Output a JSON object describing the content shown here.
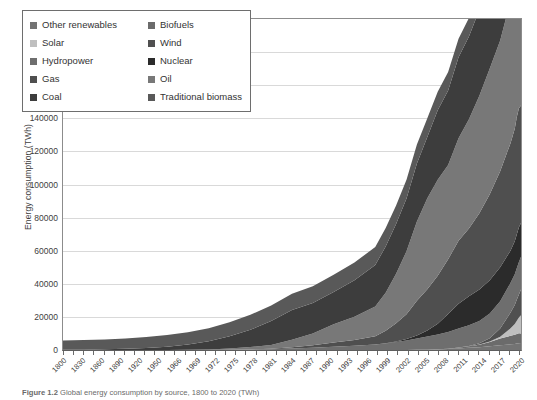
{
  "figure": {
    "caption_label": "Figure 1.2",
    "caption_text": "Global energy consumption by source, 1800 to 2020 (TWh)"
  },
  "chart_data": {
    "type": "area",
    "stacked": true,
    "title": "",
    "xlabel": "",
    "ylabel": "Energy consumption (TWh)",
    "ylim": [
      0,
      200000
    ],
    "ytick_step": 20000,
    "ytick_labels": [
      "200000",
      "180000",
      "160000",
      "140000",
      "120000",
      "100000",
      "80000",
      "60000",
      "40000",
      "20000",
      "0"
    ],
    "grid": "horizontal",
    "legend_position": "top-left-inside",
    "xlim": [
      1800,
      2020
    ],
    "xtick_labels": [
      "1800",
      "1830",
      "1860",
      "1890",
      "1920",
      "1950",
      "1966",
      "1969",
      "1972",
      "1975",
      "1978",
      "1981",
      "1984",
      "1987",
      "1990",
      "1993",
      "1996",
      "1999",
      "2002",
      "2005",
      "2008",
      "2011",
      "2014",
      "2017",
      "2020"
    ],
    "x": [
      1800,
      1810,
      1820,
      1830,
      1840,
      1850,
      1860,
      1870,
      1880,
      1890,
      1900,
      1910,
      1920,
      1930,
      1940,
      1950,
      1955,
      1960,
      1965,
      1970,
      1975,
      1980,
      1985,
      1990,
      1995,
      2000,
      2005,
      2010,
      2015,
      2017,
      2018,
      2019,
      2020
    ],
    "series": [
      {
        "name": "Traditional biomass",
        "color": "#595959",
        "values": [
          5600,
          5800,
          6000,
          6300,
          6600,
          7000,
          7400,
          7900,
          8400,
          9000,
          9400,
          9800,
          10100,
          10400,
          10700,
          11000,
          11100,
          11200,
          11300,
          11400,
          11300,
          11200,
          11100,
          11100,
          11200,
          11300,
          11400,
          11400,
          11300,
          11200,
          11200,
          11100,
          11100
        ]
      },
      {
        "name": "Coal",
        "color": "#3d3d3d",
        "values": [
          100,
          200,
          400,
          700,
          1200,
          2000,
          3200,
          5000,
          7500,
          10500,
          14500,
          18000,
          18500,
          19500,
          22000,
          25000,
          28000,
          30000,
          32000,
          35000,
          37000,
          42000,
          45000,
          49000,
          50000,
          52000,
          68000,
          80000,
          89000,
          89500,
          91000,
          90000,
          88000
        ]
      },
      {
        "name": "Oil",
        "color": "#787878",
        "values": [
          0,
          0,
          0,
          0,
          0,
          0,
          100,
          300,
          700,
          1400,
          2200,
          4500,
          7000,
          11000,
          14000,
          18000,
          23000,
          30000,
          38000,
          48000,
          55000,
          58000,
          57000,
          62000,
          66000,
          71000,
          76000,
          79000,
          86000,
          88000,
          89000,
          89500,
          82000
        ]
      },
      {
        "name": "Gas",
        "color": "#4f4f4f",
        "values": [
          0,
          0,
          0,
          0,
          0,
          0,
          0,
          0,
          100,
          200,
          400,
          800,
          1500,
          2500,
          3500,
          5000,
          7500,
          11000,
          15000,
          21000,
          25000,
          29000,
          33000,
          38000,
          41000,
          46000,
          52000,
          58000,
          65000,
          68000,
          71000,
          72000,
          71000
        ]
      },
      {
        "name": "Nuclear",
        "color": "#2b2b2b",
        "values": [
          0,
          0,
          0,
          0,
          0,
          0,
          0,
          0,
          0,
          0,
          0,
          0,
          0,
          0,
          0,
          0,
          100,
          300,
          800,
          1800,
          3500,
          6500,
          11000,
          15000,
          17500,
          19000,
          20000,
          20500,
          19500,
          20000,
          20500,
          21000,
          20500
        ]
      },
      {
        "name": "Hydropower",
        "color": "#6e6e6e",
        "values": [
          0,
          0,
          0,
          0,
          0,
          0,
          0,
          0,
          50,
          150,
          400,
          900,
          1400,
          2000,
          2600,
          3300,
          4000,
          4800,
          5800,
          6800,
          8000,
          9000,
          10000,
          11500,
          12500,
          13500,
          15000,
          16500,
          18000,
          18500,
          19000,
          19500,
          19800
        ]
      },
      {
        "name": "Wind",
        "color": "#505050",
        "values": [
          0,
          0,
          0,
          0,
          0,
          0,
          0,
          0,
          0,
          0,
          0,
          0,
          0,
          0,
          0,
          0,
          0,
          0,
          0,
          0,
          0,
          0,
          10,
          50,
          200,
          800,
          2000,
          5000,
          9500,
          11500,
          12800,
          14000,
          15500
        ]
      },
      {
        "name": "Solar",
        "color": "#bfbfbf",
        "values": [
          0,
          0,
          0,
          0,
          0,
          0,
          0,
          0,
          0,
          0,
          0,
          0,
          0,
          0,
          0,
          0,
          0,
          0,
          0,
          0,
          0,
          0,
          0,
          5,
          20,
          80,
          300,
          1000,
          4500,
          6500,
          8000,
          9500,
          11000
        ]
      },
      {
        "name": "Biofuels",
        "color": "#6b6b6b",
        "values": [
          0,
          0,
          0,
          0,
          0,
          0,
          0,
          0,
          0,
          0,
          0,
          0,
          0,
          0,
          0,
          0,
          0,
          0,
          0,
          0,
          10,
          50,
          200,
          500,
          900,
          1500,
          2600,
          4200,
          5200,
          5500,
          5800,
          6000,
          5800
        ]
      },
      {
        "name": "Other renewables",
        "color": "#737373",
        "values": [
          0,
          0,
          0,
          0,
          0,
          0,
          0,
          0,
          0,
          0,
          0,
          0,
          0,
          0,
          0,
          0,
          0,
          0,
          0,
          100,
          200,
          350,
          600,
          900,
          1300,
          1700,
          2200,
          2800,
          3400,
          3700,
          3900,
          4100,
          4200
        ]
      }
    ]
  },
  "legend": {
    "items": [
      {
        "label": "Other renewables",
        "color": "#737373"
      },
      {
        "label": "Biofuels",
        "color": "#6b6b6b"
      },
      {
        "label": "Solar",
        "color": "#bfbfbf"
      },
      {
        "label": "Wind",
        "color": "#505050"
      },
      {
        "label": "Hydropower",
        "color": "#6e6e6e"
      },
      {
        "label": "Nuclear",
        "color": "#2b2b2b"
      },
      {
        "label": "Gas",
        "color": "#4f4f4f"
      },
      {
        "label": "Oil",
        "color": "#787878"
      },
      {
        "label": "Coal",
        "color": "#3d3d3d"
      },
      {
        "label": "Traditional biomass",
        "color": "#595959"
      }
    ]
  }
}
